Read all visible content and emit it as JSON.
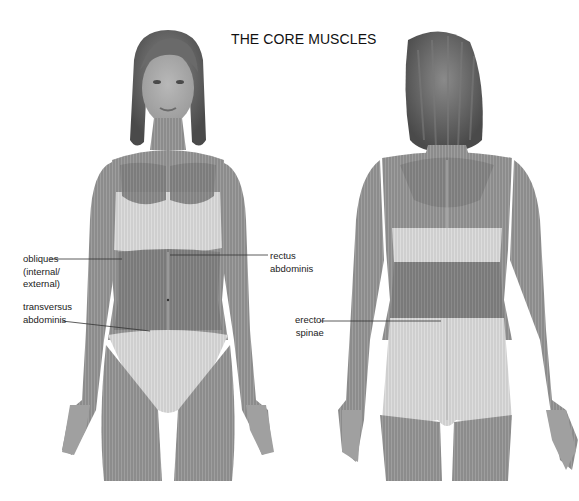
{
  "diagram": {
    "title": "THE CORE MUSCLES",
    "views": [
      {
        "name": "front view",
        "figure": "female anterior muscle map"
      },
      {
        "name": "back view",
        "figure": "female posterior muscle map"
      }
    ],
    "labels": {
      "obliques": "obliques\n(internal/\nexternal)",
      "transversus": "transversus\nabdominis",
      "rectus": "rectus\nabdominis",
      "erector": "erector\nspinae"
    },
    "colors": {
      "background": "#ffffff",
      "muscle": "#8e8e8e",
      "muscle_dark": "#6f6f6f",
      "highlight": "#d9d9d9",
      "skin": "#a4a4a4",
      "hair": "#5a5a5a",
      "leader_line": "#333333"
    }
  }
}
